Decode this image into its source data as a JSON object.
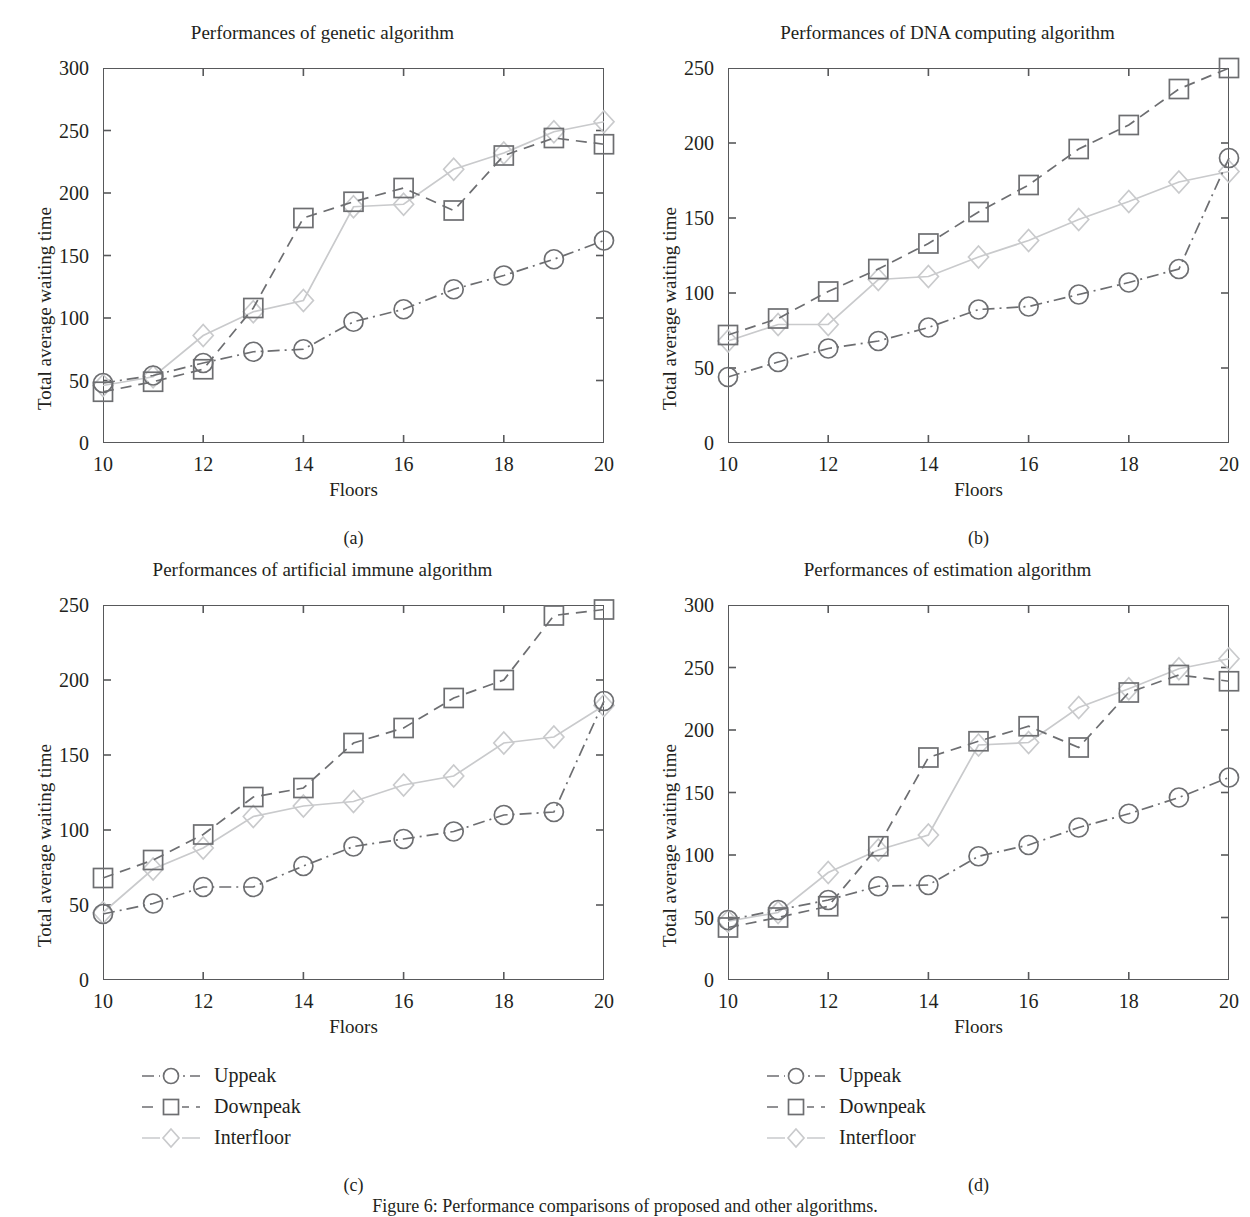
{
  "figure": {
    "caption": "Figure 6: Performance comparisons of proposed and other algorithms.",
    "legend_items": [
      {
        "label": "Uppeak",
        "marker": "circle",
        "dash": "dashdot",
        "color": "#6d6e71"
      },
      {
        "label": "Downpeak",
        "marker": "square",
        "dash": "dashed",
        "color": "#6d6e71"
      },
      {
        "label": "Interfloor",
        "marker": "diamond",
        "dash": "solid",
        "color": "#c9cacc"
      }
    ]
  },
  "panels": [
    {
      "sub_label": "(a)",
      "chart_data": {
        "type": "line",
        "title": "Performances of genetic algorithm",
        "xlabel": "Floors",
        "ylabel": "Total average waiting time",
        "x": [
          10,
          11,
          12,
          13,
          14,
          15,
          16,
          17,
          18,
          19,
          20
        ],
        "xlim": [
          10,
          20
        ],
        "ylim": [
          0,
          300
        ],
        "xticks": [
          10,
          12,
          14,
          16,
          18,
          20
        ],
        "yticks": [
          0,
          50,
          100,
          150,
          200,
          250,
          300
        ],
        "grid": false,
        "legend_position": "below-figure",
        "series": [
          {
            "name": "Uppeak",
            "marker": "circle",
            "dash": "dashdot",
            "color": "#6d6e71",
            "values": [
              48,
              54,
              64,
              73,
              75,
              97,
              107,
              123,
              134,
              147,
              162
            ]
          },
          {
            "name": "Downpeak",
            "marker": "square",
            "dash": "dashed",
            "color": "#6d6e71",
            "values": [
              41,
              49,
              59,
              108,
              180,
              193,
              204,
              186,
              230,
              244,
              239
            ]
          },
          {
            "name": "Interfloor",
            "marker": "diamond",
            "dash": "solid",
            "color": "#c9cacc",
            "values": [
              46,
              53,
              86,
              105,
              114,
              189,
              191,
              219,
              232,
              249,
              257
            ]
          }
        ]
      }
    },
    {
      "sub_label": "(b)",
      "chart_data": {
        "type": "line",
        "title": "Performances of DNA computing algorithm",
        "xlabel": "Floors",
        "ylabel": "Total average waiting time",
        "x": [
          10,
          11,
          12,
          13,
          14,
          15,
          16,
          17,
          18,
          19,
          20
        ],
        "xlim": [
          10,
          20
        ],
        "ylim": [
          0,
          250
        ],
        "xticks": [
          10,
          12,
          14,
          16,
          18,
          20
        ],
        "yticks": [
          0,
          50,
          100,
          150,
          200,
          250
        ],
        "grid": false,
        "legend_position": "below-figure",
        "series": [
          {
            "name": "Uppeak",
            "marker": "circle",
            "dash": "dashdot",
            "color": "#6d6e71",
            "values": [
              44,
              54,
              63,
              68,
              77,
              89,
              91,
              99,
              107,
              116,
              190
            ]
          },
          {
            "name": "Downpeak",
            "marker": "square",
            "dash": "dashed",
            "color": "#6d6e71",
            "values": [
              72,
              83,
              101,
              116,
              133,
              154,
              172,
              196,
              212,
              236,
              250
            ]
          },
          {
            "name": "Interfloor",
            "marker": "diamond",
            "dash": "solid",
            "color": "#c9cacc",
            "values": [
              68,
              79,
              79,
              109,
              111,
              124,
              135,
              149,
              161,
              174,
              181
            ]
          }
        ]
      }
    },
    {
      "sub_label": "(c)",
      "chart_data": {
        "type": "line",
        "title": "Performances of artificial immune algorithm",
        "xlabel": "Floors",
        "ylabel": "Total average waiting time",
        "x": [
          10,
          11,
          12,
          13,
          14,
          15,
          16,
          17,
          18,
          19,
          20
        ],
        "xlim": [
          10,
          20
        ],
        "ylim": [
          0,
          250
        ],
        "xticks": [
          10,
          12,
          14,
          16,
          18,
          20
        ],
        "yticks": [
          0,
          50,
          100,
          150,
          200,
          250
        ],
        "grid": false,
        "legend_position": "below-figure",
        "series": [
          {
            "name": "Uppeak",
            "marker": "circle",
            "dash": "dashdot",
            "color": "#6d6e71",
            "values": [
              44,
              51,
              62,
              62,
              76,
              89,
              94,
              99,
              110,
              112,
              186
            ]
          },
          {
            "name": "Downpeak",
            "marker": "square",
            "dash": "dashed",
            "color": "#6d6e71",
            "values": [
              68,
              80,
              97,
              122,
              128,
              158,
              168,
              188,
              200,
              243,
              247
            ]
          },
          {
            "name": "Interfloor",
            "marker": "diamond",
            "dash": "solid",
            "color": "#c9cacc",
            "values": [
              45,
              74,
              88,
              109,
              116,
              119,
              130,
              136,
              158,
              162,
              183
            ]
          }
        ]
      }
    },
    {
      "sub_label": "(d)",
      "chart_data": {
        "type": "line",
        "title": "Performances of estimation algorithm",
        "xlabel": "Floors",
        "ylabel": "Total average waiting time",
        "x": [
          10,
          11,
          12,
          13,
          14,
          15,
          16,
          17,
          18,
          19,
          20
        ],
        "xlim": [
          10,
          20
        ],
        "ylim": [
          0,
          300
        ],
        "xticks": [
          10,
          12,
          14,
          16,
          18,
          20
        ],
        "yticks": [
          0,
          50,
          100,
          150,
          200,
          250,
          300
        ],
        "grid": false,
        "legend_position": "below-figure",
        "series": [
          {
            "name": "Uppeak",
            "marker": "circle",
            "dash": "dashdot",
            "color": "#6d6e71",
            "values": [
              48,
              56,
              64,
              75,
              76,
              99,
              108,
              122,
              133,
              146,
              162
            ]
          },
          {
            "name": "Downpeak",
            "marker": "square",
            "dash": "dashed",
            "color": "#6d6e71",
            "values": [
              42,
              50,
              59,
              107,
              178,
              191,
              203,
              186,
              230,
              244,
              239
            ]
          },
          {
            "name": "Interfloor",
            "marker": "diamond",
            "dash": "solid",
            "color": "#c9cacc",
            "values": [
              47,
              54,
              86,
              104,
              116,
              188,
              190,
              218,
              233,
              249,
              257
            ]
          }
        ]
      }
    }
  ]
}
